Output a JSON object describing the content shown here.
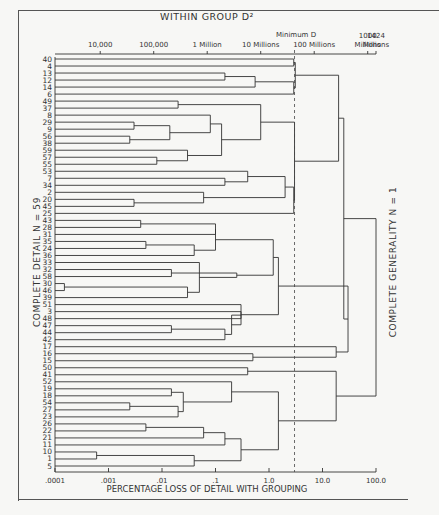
{
  "chart_data": {
    "type": "dendrogram",
    "title": "WITHIN GROUP D²",
    "xlabel": "PERCENTAGE LOSS OF DETAIL WITH GROUPING",
    "left_label": "COMPLETE DETAIL   N = 59",
    "right_label": "COMPLETE GENERALITY   N = 1",
    "threshold_label": "Minimum D",
    "x_scale": "log",
    "xlim": [
      0.0001,
      100.0
    ],
    "bottom_ticks": [
      {
        "label": ".0001",
        "value": 0.0001
      },
      {
        "label": ".001",
        "value": 0.001
      },
      {
        "label": ".01",
        "value": 0.01
      },
      {
        "label": ".1",
        "value": 0.1
      },
      {
        "label": "1.0",
        "value": 1.0
      },
      {
        "label": "10.0",
        "value": 10.0
      },
      {
        "label": "100.0",
        "value": 100.0
      }
    ],
    "top_ticks": [
      {
        "label": "10,000",
        "value": 0.0007
      },
      {
        "label": "100,000",
        "value": 0.007
      },
      {
        "label": "1 Million",
        "value": 0.07
      },
      {
        "label": "10 Millions",
        "value": 0.7
      },
      {
        "label": "100 Millions",
        "value": 7.0
      },
      {
        "label": "1000 Millions",
        "value": 70.0
      },
      {
        "label": "1424 Millions",
        "value": 100.0
      }
    ],
    "threshold_value": 3.0,
    "leaves": [
      "40",
      "4",
      "13",
      "12",
      "14",
      "6",
      "49",
      "37",
      "8",
      "29",
      "9",
      "56",
      "38",
      "59",
      "57",
      "55",
      "53",
      "7",
      "34",
      "2",
      "20",
      "45",
      "25",
      "43",
      "28",
      "31",
      "35",
      "24",
      "36",
      "33",
      "32",
      "58",
      "30",
      "46",
      "39",
      "51",
      "3",
      "48",
      "47",
      "44",
      "42",
      "17",
      "16",
      "15",
      "50",
      "41",
      "52",
      "19",
      "18",
      "54",
      "27",
      "23",
      "26",
      "22",
      "21",
      "11",
      "10",
      "1",
      "5"
    ],
    "merges": [
      {
        "a": "L0",
        "b": "L1",
        "h": 2.9,
        "id": "M1"
      },
      {
        "a": "L2",
        "b": "L3",
        "h": 0.15,
        "id": "M2"
      },
      {
        "a": "M2",
        "b": "L4",
        "h": 0.55,
        "id": "M3"
      },
      {
        "a": "M3",
        "b": "L5",
        "h": 2.9,
        "id": "M4"
      },
      {
        "a": "M1",
        "b": "M4",
        "h": 3.1,
        "id": "M5"
      },
      {
        "a": "L6",
        "b": "L7",
        "h": 0.02,
        "id": "M6"
      },
      {
        "a": "L9",
        "b": "L10",
        "h": 0.003,
        "id": "M7"
      },
      {
        "a": "L11",
        "b": "L12",
        "h": 0.0025,
        "id": "M8"
      },
      {
        "a": "M7",
        "b": "M8",
        "h": 0.014,
        "id": "M9"
      },
      {
        "a": "M9",
        "b": "L8",
        "h": 0.08,
        "id": "M10"
      },
      {
        "a": "L14",
        "b": "L15",
        "h": 0.008,
        "id": "M11"
      },
      {
        "a": "M11",
        "b": "L13",
        "h": 0.03,
        "id": "M12"
      },
      {
        "a": "M10",
        "b": "M12",
        "h": 0.13,
        "id": "M13"
      },
      {
        "a": "M6",
        "b": "M13",
        "h": 0.7,
        "id": "M14"
      },
      {
        "a": "L17",
        "b": "L18",
        "h": 0.15,
        "id": "M15"
      },
      {
        "a": "L16",
        "b": "M15",
        "h": 0.4,
        "id": "M16"
      },
      {
        "a": "L20",
        "b": "L21",
        "h": 0.003,
        "id": "M17"
      },
      {
        "a": "L19",
        "b": "M17",
        "h": 0.06,
        "id": "M18"
      },
      {
        "a": "M16",
        "b": "M18",
        "h": 2.0,
        "id": "M19"
      },
      {
        "a": "M19",
        "b": "L22",
        "h": 2.9,
        "id": "M20"
      },
      {
        "a": "M14",
        "b": "M20",
        "h": 3.0,
        "id": "M21"
      },
      {
        "a": "M5",
        "b": "M21",
        "h": 20.0,
        "id": "M22"
      },
      {
        "a": "L23",
        "b": "L24",
        "h": 0.004,
        "id": "M23"
      },
      {
        "a": "L26",
        "b": "L27",
        "h": 0.005,
        "id": "M24"
      },
      {
        "a": "M24",
        "b": "L28",
        "h": 0.04,
        "id": "M25"
      },
      {
        "a": "M23",
        "b": "L25",
        "h": 0.1,
        "id": "M26"
      },
      {
        "a": "M26",
        "b": "M25",
        "h": 0.1,
        "id": "M27"
      },
      {
        "a": "L30",
        "b": "L31",
        "h": 0.015,
        "id": "M28"
      },
      {
        "a": "L32",
        "b": "L33",
        "h": 0.00015,
        "id": "M29"
      },
      {
        "a": "M29",
        "b": "L34",
        "h": 0.03,
        "id": "M30"
      },
      {
        "a": "M30",
        "b": "L29",
        "h": 0.05,
        "id": "M31"
      },
      {
        "a": "M28",
        "b": "M31",
        "h": 0.25,
        "id": "M32"
      },
      {
        "a": "M27",
        "b": "M32",
        "h": 1.2,
        "id": "M33"
      },
      {
        "a": "L36",
        "b": "L37",
        "h": 0.3,
        "id": "M34"
      },
      {
        "a": "L38",
        "b": "L39",
        "h": 0.015,
        "id": "M35"
      },
      {
        "a": "M35",
        "b": "L40",
        "h": 0.15,
        "id": "M36"
      },
      {
        "a": "M34",
        "b": "M36",
        "h": 0.2,
        "id": "M37"
      },
      {
        "a": "L35",
        "b": "M37",
        "h": 0.3,
        "id": "M38"
      },
      {
        "a": "M33",
        "b": "M38",
        "h": 1.5,
        "id": "M39"
      },
      {
        "a": "L42",
        "b": "L43",
        "h": 0.5,
        "id": "M40"
      },
      {
        "a": "L41",
        "b": "M40",
        "h": 18.0,
        "id": "M41"
      },
      {
        "a": "M39",
        "b": "M41",
        "h": 30.0,
        "id": "M42"
      },
      {
        "a": "L44",
        "b": "L45",
        "h": 0.4,
        "id": "M43"
      },
      {
        "a": "L47",
        "b": "L48",
        "h": 0.015,
        "id": "M44"
      },
      {
        "a": "L49",
        "b": "L50",
        "h": 0.0025,
        "id": "M45"
      },
      {
        "a": "M45",
        "b": "L51",
        "h": 0.02,
        "id": "M46"
      },
      {
        "a": "M44",
        "b": "M46",
        "h": 0.025,
        "id": "M47"
      },
      {
        "a": "M47",
        "b": "L46",
        "h": 0.2,
        "id": "M48"
      },
      {
        "a": "L52",
        "b": "L53",
        "h": 0.005,
        "id": "M49"
      },
      {
        "a": "M49",
        "b": "L54",
        "h": 0.06,
        "id": "M50"
      },
      {
        "a": "M50",
        "b": "L55",
        "h": 0.15,
        "id": "M51"
      },
      {
        "a": "L56",
        "b": "L57",
        "h": 0.0006,
        "id": "M52"
      },
      {
        "a": "M52",
        "b": "L58",
        "h": 0.04,
        "id": "M53"
      },
      {
        "a": "M51",
        "b": "M53",
        "h": 0.3,
        "id": "M54"
      },
      {
        "a": "M48",
        "b": "M54",
        "h": 1.5,
        "id": "M55"
      },
      {
        "a": "M43",
        "b": "M55",
        "h": 18.0,
        "id": "M56"
      },
      {
        "a": "M22",
        "b": "M42",
        "h": 25.0,
        "id": "M57"
      },
      {
        "a": "M57",
        "b": "M56",
        "h": 100.0,
        "id": "M58"
      }
    ]
  }
}
